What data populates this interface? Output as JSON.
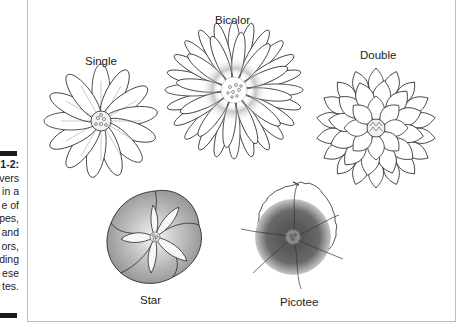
{
  "caption": {
    "figure_number": "1-2:",
    "lines_visible": [
      "vers",
      "in a",
      "e of",
      "pes,",
      "and",
      "ors,",
      "ding",
      "ese",
      "tes."
    ],
    "full_text_fragment": "Flowers come in a range of shapes, and colors, including these types."
  },
  "figure": {
    "flowers": [
      {
        "id": "single",
        "label": "Single"
      },
      {
        "id": "bicolor",
        "label": "Bicolor"
      },
      {
        "id": "double",
        "label": "Double"
      },
      {
        "id": "star",
        "label": "Star"
      },
      {
        "id": "picotee",
        "label": "Picotee"
      }
    ]
  },
  "colors": {
    "ink": "#2a2a2a",
    "frame": "#bdbdbd",
    "bar": "#1a1a1a",
    "shade_dark": "#555555",
    "shade_light": "#e6e6e6"
  }
}
